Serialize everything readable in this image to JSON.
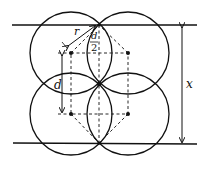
{
  "diagram": {
    "labels": {
      "radius": "r",
      "half_d_num": "d",
      "half_d_den": "2",
      "spacing": "d",
      "height": "x"
    },
    "colors": {
      "stroke": "#111111",
      "background": "#ffffff"
    }
  }
}
